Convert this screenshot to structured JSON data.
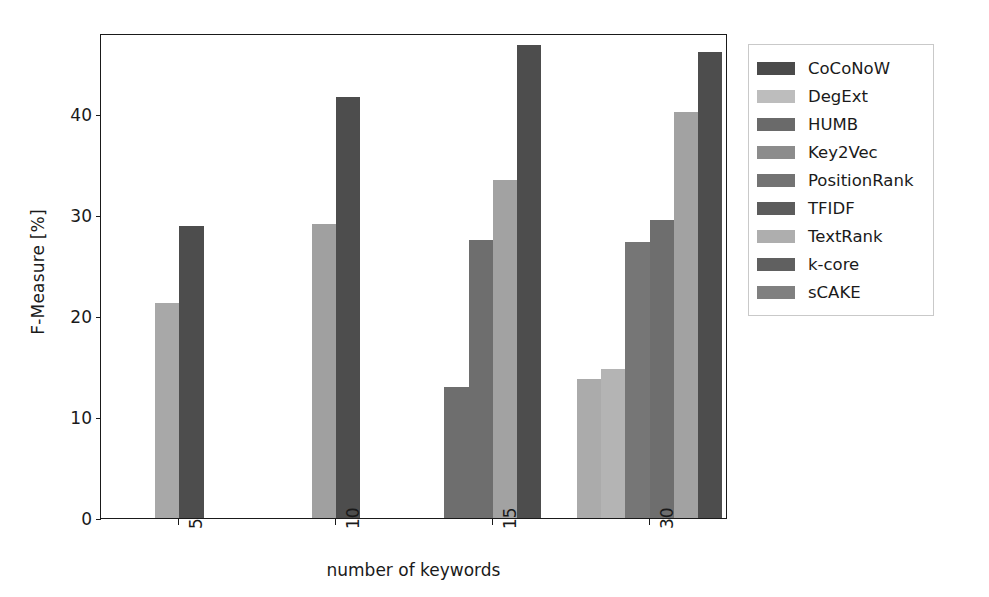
{
  "chart_data": {
    "type": "bar",
    "title": "",
    "xlabel": "number of keywords",
    "ylabel": "F-Measure [%]",
    "categories": [
      "5",
      "10",
      "15",
      "30"
    ],
    "ylim": [
      0,
      48
    ],
    "yticks": [
      0,
      10,
      20,
      30,
      40
    ],
    "ytick_labels": [
      "0",
      "10",
      "20",
      "30",
      "40"
    ],
    "grid": false,
    "legend_position": "right",
    "series": [
      {
        "name": "CoCoNoW",
        "color": "#4a4a4a",
        "values": [
          28.9,
          41.7,
          46.8,
          46.1
        ]
      },
      {
        "name": "DegExt",
        "color": "#b8b8b8",
        "values": [
          null,
          null,
          null,
          13.8
        ]
      },
      {
        "name": "HUMB",
        "color": "#6a6a6a",
        "values": [
          null,
          null,
          null,
          null
        ]
      },
      {
        "name": "Key2Vec",
        "color": "#8a8a8a",
        "values": [
          null,
          null,
          null,
          null
        ]
      },
      {
        "name": "PositionRank",
        "color": "#707070",
        "values": [
          null,
          null,
          27.5,
          27.3
        ]
      },
      {
        "name": "TFIDF",
        "color": "#5a5a5a",
        "values": [
          null,
          null,
          13.0,
          null
        ]
      },
      {
        "name": "TextRank",
        "color": "#a8a8a8",
        "values": [
          null,
          null,
          null,
          14.7
        ]
      },
      {
        "name": "k-core",
        "color": "#5d5d5d",
        "values": [
          null,
          null,
          null,
          29.5
        ]
      },
      {
        "name": "sCAKE",
        "color": "#9b9b9b",
        "values": [
          21.3,
          29.1,
          33.5,
          40.2
        ]
      }
    ],
    "bars": [
      {
        "group": "5",
        "series": "sCAKE",
        "value": 21.3,
        "color": "#a8a8a8"
      },
      {
        "group": "5",
        "series": "CoCoNoW",
        "value": 28.9,
        "color": "#4d4d4d"
      },
      {
        "group": "10",
        "series": "sCAKE",
        "value": 29.1,
        "color": "#a0a0a0"
      },
      {
        "group": "10",
        "series": "CoCoNoW",
        "value": 41.7,
        "color": "#4d4d4d"
      },
      {
        "group": "15",
        "series": "TFIDF",
        "value": 13.0,
        "color": "#6e6e6e"
      },
      {
        "group": "15",
        "series": "PositionRank",
        "value": 27.5,
        "color": "#6e6e6e"
      },
      {
        "group": "15",
        "series": "sCAKE",
        "value": 33.5,
        "color": "#a2a2a2"
      },
      {
        "group": "15",
        "series": "CoCoNoW",
        "value": 46.8,
        "color": "#4d4d4d"
      },
      {
        "group": "30",
        "series": "DegExt",
        "value": 13.8,
        "color": "#ababab"
      },
      {
        "group": "30",
        "series": "TextRank",
        "value": 14.7,
        "color": "#b4b4b4"
      },
      {
        "group": "30",
        "series": "PositionRank",
        "value": 27.3,
        "color": "#767676"
      },
      {
        "group": "30",
        "series": "k-core",
        "value": 29.5,
        "color": "#6e6e6e"
      },
      {
        "group": "30",
        "series": "sCAKE",
        "value": 40.2,
        "color": "#a2a2a2"
      },
      {
        "group": "30",
        "series": "CoCoNoW",
        "value": 46.1,
        "color": "#4d4d4d"
      }
    ]
  },
  "axes": {
    "ylabel": "F-Measure [%]",
    "xlabel": "number of keywords",
    "ytick_labels": [
      "0",
      "10",
      "20",
      "30",
      "40"
    ],
    "xtick_labels": [
      "5",
      "10",
      "15",
      "30"
    ]
  },
  "legend": {
    "items": [
      {
        "label": "CoCoNoW",
        "color": "#4a4a4a"
      },
      {
        "label": "DegExt",
        "color": "#bdbdbd"
      },
      {
        "label": "HUMB",
        "color": "#6a6a6a"
      },
      {
        "label": "Key2Vec",
        "color": "#8c8c8c"
      },
      {
        "label": "PositionRank",
        "color": "#737373"
      },
      {
        "label": "TFIDF",
        "color": "#5c5c5c"
      },
      {
        "label": "TextRank",
        "color": "#aeaeae"
      },
      {
        "label": "k-core",
        "color": "#606060"
      },
      {
        "label": "sCAKE",
        "color": "#808080"
      }
    ]
  }
}
